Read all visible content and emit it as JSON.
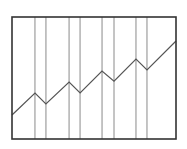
{
  "chart_data": {
    "type": "line",
    "title": "",
    "xlabel": "",
    "ylabel": "",
    "grid": "vertical lines at each vertex",
    "legend": null,
    "xlim": [
      0,
      100
    ],
    "ylim": [
      0,
      100
    ],
    "series": [
      {
        "name": "series-1",
        "x": [
          0,
          14.0,
          20.7,
          34.8,
          41.5,
          54.9,
          62.2,
          75.6,
          82.3,
          100
        ],
        "values": [
          19.7,
          37.7,
          28.7,
          46.7,
          37.7,
          55.7,
          47.5,
          65.6,
          56.6,
          80.3
        ]
      }
    ],
    "vertical_gridlines_x": [
      14.0,
      20.7,
      34.8,
      41.5,
      54.9,
      62.2,
      75.6,
      82.3
    ]
  },
  "style": {
    "frame_color": "#333333",
    "gridline_color": "#8a8a8a",
    "line_color": "#555555",
    "background": "#ffffff"
  },
  "plot_area": {
    "left": 12,
    "top": 17,
    "width": 164,
    "height": 122
  }
}
